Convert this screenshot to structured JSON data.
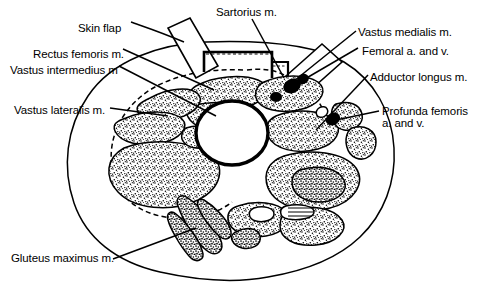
{
  "figure": {
    "line_color": "#000000",
    "background_color": "#ffffff",
    "stipple_color": "#000000",
    "bone_fill": "#ffffff"
  },
  "labels": [
    {
      "id": "skin-flap",
      "text": "Skin flap",
      "side": "left",
      "x": 78,
      "y": 22
    },
    {
      "id": "rectus-femoris",
      "text": "Rectus femoris m.",
      "side": "left",
      "x": 33,
      "y": 48
    },
    {
      "id": "vastus-intermedius",
      "text": "Vastus intermedius m",
      "side": "left",
      "x": 10,
      "y": 64
    },
    {
      "id": "vastus-lateralis",
      "text": "Vastus lateralis m.",
      "side": "left",
      "x": 14,
      "y": 104
    },
    {
      "id": "gluteus-maximus",
      "text": "Gluteus maximus m.",
      "side": "left",
      "x": 11,
      "y": 258
    },
    {
      "id": "sartorius",
      "text": "Sartorius m.",
      "side": "top",
      "x": 216,
      "y": 6
    },
    {
      "id": "vastus-medialis",
      "text": "Vastus medialis m.",
      "side": "right",
      "x": 358,
      "y": 26
    },
    {
      "id": "femoral-av",
      "text": "Femoral a. and v.",
      "side": "right",
      "x": 362,
      "y": 45
    },
    {
      "id": "adductor-longus",
      "text": "Adductor longus m.",
      "side": "right",
      "x": 370,
      "y": 71
    },
    {
      "id": "profunda-femoris-1",
      "text": "Profunda femoris",
      "side": "right",
      "x": 382,
      "y": 105
    },
    {
      "id": "profunda-femoris-2",
      "text": "a. and v.",
      "side": "right",
      "x": 382,
      "y": 117
    }
  ],
  "structures": [
    {
      "id": "femur",
      "name": "Femur (bone)",
      "type": "bone"
    },
    {
      "id": "skin-outline",
      "name": "Skin / outer thigh outline",
      "type": "outline"
    },
    {
      "id": "fascia-dashed",
      "name": "Fascia lata (dashed)",
      "type": "dashed-outline"
    },
    {
      "id": "skin-flap-left",
      "name": "Reflected skin flap (left)",
      "type": "flap"
    },
    {
      "id": "skin-flap-right",
      "name": "Reflected skin flap (right)",
      "type": "flap"
    },
    {
      "id": "muscle-bundles",
      "name": "Stippled muscle compartments",
      "type": "muscle"
    }
  ]
}
